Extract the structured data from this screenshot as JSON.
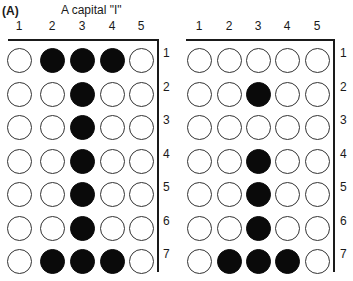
{
  "panel_a": {
    "label": "(A)",
    "caption": "A capital \"I\"",
    "column_labels": [
      "1",
      "2",
      "3",
      "4",
      "5"
    ],
    "row_labels": [
      "1",
      "2",
      "3",
      "4",
      "5",
      "6",
      "7"
    ],
    "grid": [
      [
        0,
        1,
        1,
        1,
        0
      ],
      [
        0,
        0,
        1,
        0,
        0
      ],
      [
        0,
        0,
        1,
        0,
        0
      ],
      [
        0,
        0,
        1,
        0,
        0
      ],
      [
        0,
        0,
        1,
        0,
        0
      ],
      [
        0,
        0,
        1,
        0,
        0
      ],
      [
        0,
        1,
        1,
        1,
        0
      ]
    ]
  },
  "panel_b": {
    "column_labels": [
      "1",
      "2",
      "3",
      "4",
      "5"
    ],
    "row_labels": [
      "1",
      "2",
      "3",
      "4",
      "5",
      "6",
      "7"
    ],
    "grid": [
      [
        0,
        0,
        0,
        0,
        0
      ],
      [
        0,
        0,
        1,
        0,
        0
      ],
      [
        0,
        0,
        0,
        0,
        0
      ],
      [
        0,
        0,
        1,
        0,
        0
      ],
      [
        0,
        0,
        1,
        0,
        0
      ],
      [
        0,
        0,
        1,
        0,
        0
      ],
      [
        0,
        1,
        1,
        1,
        0
      ]
    ]
  },
  "colors": {
    "filled": "#0a0a0a",
    "outline": "#333333",
    "background": "#ffffff"
  }
}
